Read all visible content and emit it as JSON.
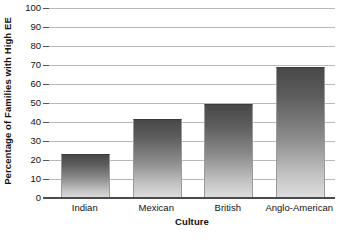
{
  "chart_data": {
    "type": "bar",
    "title": "",
    "categories": [
      "Indian",
      "Mexican",
      "British",
      "Anglo-American"
    ],
    "values": [
      22.5,
      41,
      49,
      68.5
    ],
    "xlabel": "Culture",
    "ylabel": "Percentage of Families with High EE",
    "ylim": [
      0,
      100
    ],
    "yticks": [
      0,
      10,
      20,
      30,
      40,
      50,
      60,
      70,
      80,
      90,
      100
    ],
    "ytick_labels": [
      "0",
      "10",
      "20",
      "30",
      "40",
      "50",
      "60",
      "70",
      "80",
      "90",
      "100"
    ],
    "grid": true,
    "legend": false,
    "legend_position": "none",
    "colors": {
      "bar_top": "#484848",
      "bar_bottom": "#dedede",
      "gridline": "#b9b9b9",
      "axis": "#4a4a4a",
      "text": "#111111",
      "background": "#ffffff"
    }
  }
}
